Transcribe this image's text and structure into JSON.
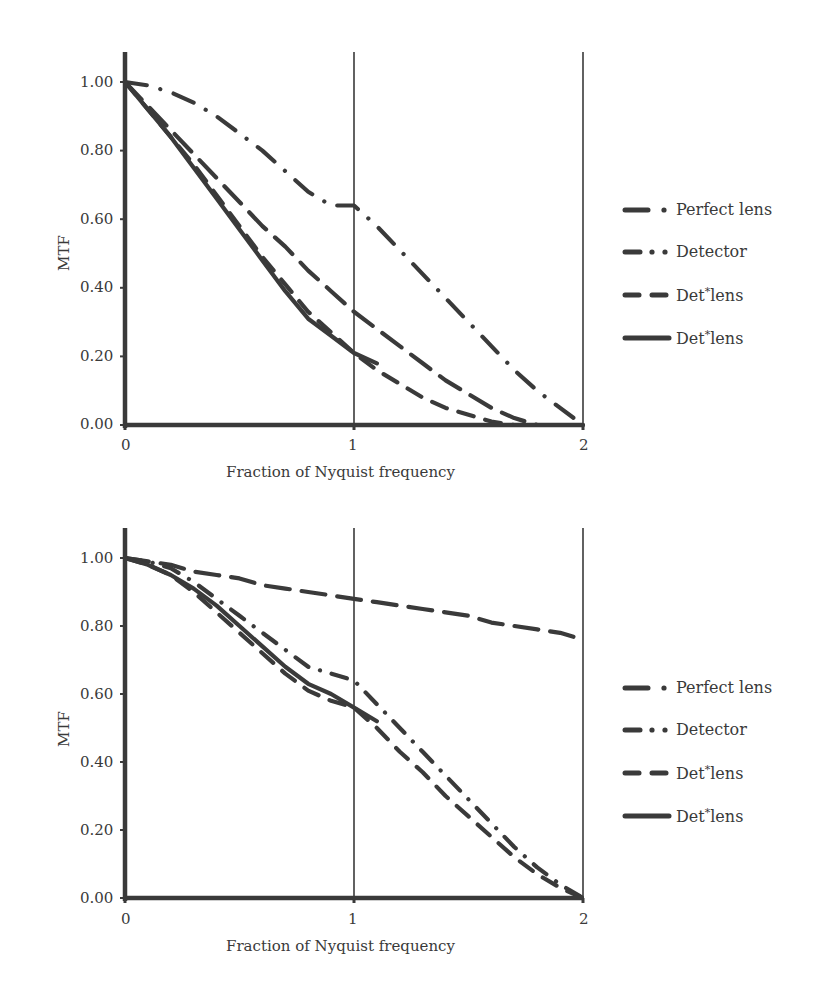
{
  "charts": [
    {
      "id": "top",
      "ylabel": "MTF",
      "xlabel": "Fraction of Nyquist frequency",
      "yticks": [
        "1.00",
        "0.80",
        "0.60",
        "0.40",
        "0.20",
        "0.00"
      ],
      "xticks": [
        "0",
        "1",
        "2"
      ],
      "legend": [
        {
          "pre": "Perfect lens",
          "sup": "",
          "post": ""
        },
        {
          "pre": "Detector",
          "sup": "",
          "post": ""
        },
        {
          "pre": "Det",
          "sup": "*",
          "post": "lens"
        },
        {
          "pre": "Det",
          "sup": "*",
          "post": "lens"
        }
      ]
    },
    {
      "id": "bottom",
      "ylabel": "MTF",
      "xlabel": "Fraction of Nyquist frequency",
      "yticks": [
        "1.00",
        "0.80",
        "0.60",
        "0.40",
        "0.20",
        "0.00"
      ],
      "xticks": [
        "0",
        "1",
        "2"
      ],
      "legend": [
        {
          "pre": "Perfect lens",
          "sup": "",
          "post": ""
        },
        {
          "pre": "Detector",
          "sup": "",
          "post": ""
        },
        {
          "pre": "Det",
          "sup": "*",
          "post": "lens"
        },
        {
          "pre": "Det",
          "sup": "*",
          "post": "lens"
        }
      ]
    }
  ],
  "chart_data": [
    {
      "type": "line",
      "title": "",
      "xlabel": "Fraction of Nyquist frequency",
      "ylabel": "MTF",
      "xlim": [
        0,
        2
      ],
      "ylim": [
        0,
        1.1
      ],
      "xticks": [
        0,
        1,
        2
      ],
      "yticks": [
        0,
        0.2,
        0.4,
        0.6,
        0.8,
        1.0
      ],
      "grid": "vertical lines at x=1 and x=2",
      "legend_position": "right",
      "x": [
        0,
        0.1,
        0.2,
        0.3,
        0.4,
        0.5,
        0.6,
        0.7,
        0.8,
        0.9,
        1.0,
        1.1,
        1.2,
        1.3,
        1.4,
        1.5,
        1.6,
        1.7,
        1.8,
        1.9,
        2.0
      ],
      "series": [
        {
          "name": "Perfect lens",
          "style": "long-dash-dot",
          "values": [
            1.0,
            0.99,
            0.97,
            0.94,
            0.9,
            0.85,
            0.8,
            0.74,
            0.68,
            0.64,
            0.64,
            0.58,
            0.51,
            0.44,
            0.37,
            0.3,
            0.23,
            0.16,
            0.1,
            0.05,
            0.0
          ]
        },
        {
          "name": "Detector",
          "style": "long-dash",
          "values": [
            1.0,
            0.93,
            0.86,
            0.79,
            0.72,
            0.65,
            0.58,
            0.52,
            0.45,
            0.39,
            0.33,
            0.28,
            0.23,
            0.18,
            0.13,
            0.09,
            0.05,
            0.02,
            0.0,
            0.0,
            0.0
          ]
        },
        {
          "name": "Det*lens (dash)",
          "style": "dash",
          "values": [
            1.0,
            0.92,
            0.84,
            0.76,
            0.67,
            0.58,
            0.49,
            0.41,
            0.33,
            0.27,
            0.21,
            0.16,
            0.12,
            0.08,
            0.05,
            0.03,
            0.01,
            0.0,
            0.0,
            0.0,
            0.0
          ]
        },
        {
          "name": "Det*lens (solid)",
          "style": "solid",
          "values": [
            1.0,
            0.92,
            0.84,
            0.75,
            0.66,
            0.57,
            0.48,
            0.39,
            0.31,
            0.26,
            0.21,
            0.18,
            null,
            null,
            null,
            null,
            null,
            null,
            null,
            null,
            null
          ]
        }
      ]
    },
    {
      "type": "line",
      "title": "",
      "xlabel": "Fraction of Nyquist frequency",
      "ylabel": "MTF",
      "xlim": [
        0,
        2
      ],
      "ylim": [
        0,
        1.1
      ],
      "xticks": [
        0,
        1,
        2
      ],
      "yticks": [
        0,
        0.2,
        0.4,
        0.6,
        0.8,
        1.0
      ],
      "grid": "vertical lines at x=1 and x=2",
      "legend_position": "right",
      "x": [
        0,
        0.1,
        0.2,
        0.3,
        0.4,
        0.5,
        0.6,
        0.7,
        0.8,
        0.9,
        1.0,
        1.1,
        1.2,
        1.3,
        1.4,
        1.5,
        1.6,
        1.7,
        1.8,
        1.9,
        2.0
      ],
      "series": [
        {
          "name": "Perfect lens",
          "style": "long-dash",
          "values": [
            1.0,
            0.99,
            0.98,
            0.96,
            0.95,
            0.94,
            0.92,
            0.91,
            0.9,
            0.89,
            0.88,
            0.87,
            0.86,
            0.85,
            0.84,
            0.83,
            0.81,
            0.8,
            0.79,
            0.78,
            0.76
          ]
        },
        {
          "name": "Detector",
          "style": "dash-dot",
          "values": [
            1.0,
            0.99,
            0.97,
            0.93,
            0.88,
            0.83,
            0.78,
            0.73,
            0.68,
            0.66,
            0.64,
            0.57,
            0.5,
            0.43,
            0.36,
            0.29,
            0.22,
            0.15,
            0.09,
            0.04,
            0.0
          ]
        },
        {
          "name": "Det*lens (dash)",
          "style": "dash",
          "values": [
            1.0,
            0.98,
            0.95,
            0.9,
            0.84,
            0.78,
            0.72,
            0.66,
            0.61,
            0.58,
            0.56,
            0.5,
            0.43,
            0.37,
            0.3,
            0.24,
            0.18,
            0.12,
            0.07,
            0.03,
            0.0
          ]
        },
        {
          "name": "Det*lens (solid)",
          "style": "solid",
          "values": [
            1.0,
            0.98,
            0.95,
            0.91,
            0.86,
            0.8,
            0.74,
            0.68,
            0.63,
            0.6,
            0.56,
            0.52,
            null,
            null,
            null,
            null,
            null,
            null,
            null,
            null,
            null
          ]
        }
      ]
    }
  ]
}
